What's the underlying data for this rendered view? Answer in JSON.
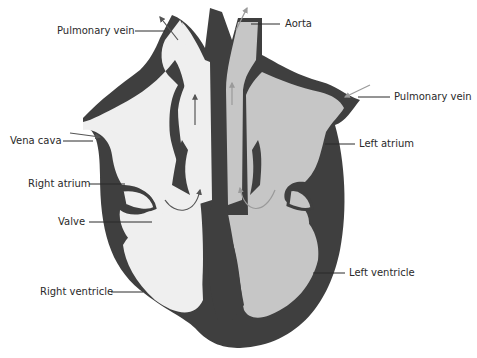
{
  "colors": {
    "wall": "#3f3f3f",
    "right_side_blood": "#efefef",
    "left_side_blood": "#c6c6c6",
    "arrow_deoxygenated": "#555555",
    "arrow_oxygenated": "#9a9a9a",
    "leader_line": "#2a2a2a",
    "background": "#ffffff"
  },
  "labels": {
    "pulmonary_vein_left": "Pulmonary vein",
    "aorta": "Aorta",
    "pulmonary_vein_right": "Pulmonary vein",
    "vena_cava": "Vena cava",
    "left_atrium": "Left atrium",
    "right_atrium": "Right atrium",
    "valve": "Valve",
    "left_ventricle": "Left ventricle",
    "right_ventricle": "Right ventricle"
  }
}
